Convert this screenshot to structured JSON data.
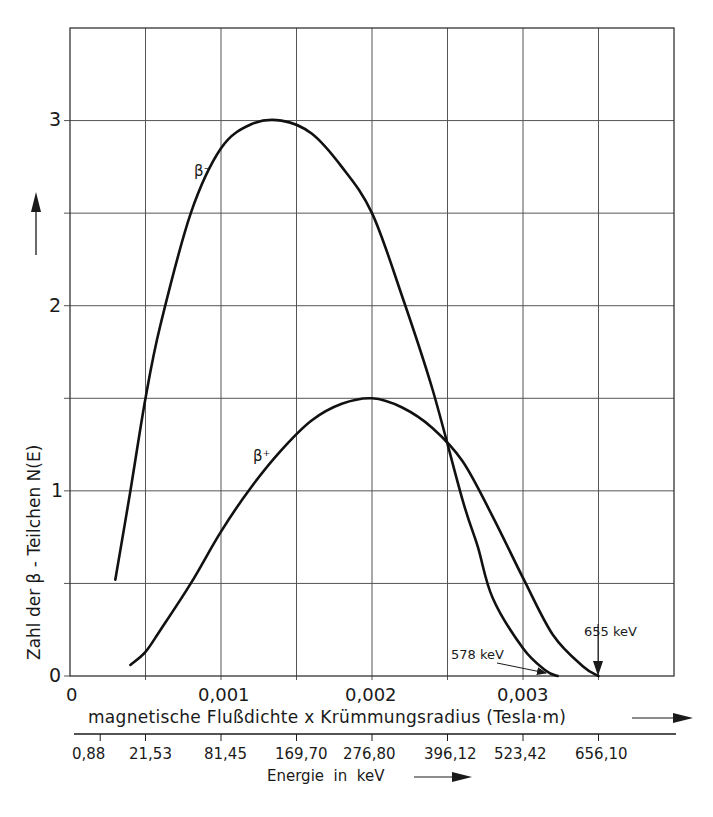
{
  "chart_data": {
    "type": "line",
    "title": "",
    "xlabel": "magnetische Flußdichte x Krümmungsradius (Tesla·m)",
    "x2label": "Energie in keV",
    "ylabel": "Zahl der β - Teilchen N(E)",
    "xlim": [
      0,
      0.004
    ],
    "ylim": [
      0,
      3.5
    ],
    "grid": true,
    "x_ticks": [
      "0",
      "0,001",
      "0,002",
      "0,003"
    ],
    "x_tick_values": [
      0,
      0.001,
      0.002,
      0.003
    ],
    "y_ticks": [
      "0",
      "1",
      "2",
      "3"
    ],
    "energy_ticks": [
      "0,88",
      "21,53",
      "81,45",
      "169,70",
      "276,80",
      "396,12",
      "523,42",
      "656,10"
    ],
    "energy_tick_positions": [
      0.0002,
      0.0005,
      0.001,
      0.0015,
      0.002,
      0.0025,
      0.003,
      0.0035
    ],
    "series": [
      {
        "name": "β⁻",
        "x": [
          0.0003,
          0.0004,
          0.0005,
          0.0006,
          0.0008,
          0.001,
          0.0012,
          0.0014,
          0.0016,
          0.0018,
          0.002,
          0.0022,
          0.0024,
          0.0026,
          0.0027,
          0.0028,
          0.003,
          0.00315,
          0.00323
        ],
        "values": [
          0.52,
          1.0,
          1.5,
          1.9,
          2.5,
          2.85,
          2.98,
          3.0,
          2.93,
          2.75,
          2.5,
          2.05,
          1.55,
          0.95,
          0.7,
          0.42,
          0.15,
          0.03,
          0.0
        ]
      },
      {
        "name": "β⁺",
        "x": [
          0.0004,
          0.0005,
          0.0006,
          0.0008,
          0.001,
          0.0012,
          0.0014,
          0.0016,
          0.0018,
          0.002,
          0.0022,
          0.0024,
          0.0026,
          0.0028,
          0.003,
          0.0032,
          0.0034,
          0.0035
        ],
        "values": [
          0.06,
          0.13,
          0.25,
          0.5,
          0.78,
          1.02,
          1.22,
          1.38,
          1.47,
          1.5,
          1.45,
          1.34,
          1.16,
          0.86,
          0.53,
          0.22,
          0.05,
          0.0
        ]
      }
    ],
    "annotations": [
      {
        "text": "β⁻",
        "x": 0.00083,
        "y": 2.62
      },
      {
        "text": "β⁺",
        "x": 0.00125,
        "y": 1.12
      },
      {
        "text": "578 keV",
        "points_to": [
          0.00323,
          0.0
        ]
      },
      {
        "text": "655 keV",
        "points_to": [
          0.0035,
          0.0
        ]
      }
    ]
  },
  "labels": {
    "x_axis_title": "magnetische Flußdichte x Krümmungsradius (Tesla·m)",
    "energy_axis_title": "Energie  in  keV",
    "y_axis_title": "Zahl der β - Teilchen N(E)",
    "beta_minus": "β⁻",
    "beta_plus": "β⁺",
    "endpoint_578": "578 keV",
    "endpoint_655": "655 keV",
    "x_ticks": [
      "0",
      "0,001",
      "0,002",
      "0,003"
    ],
    "y_ticks": [
      "0",
      "1",
      "2",
      "3"
    ],
    "energy_ticks": [
      "0,88",
      "21,53",
      "81,45",
      "169,70",
      "276,80",
      "396,12",
      "523,42",
      "656,10"
    ]
  }
}
